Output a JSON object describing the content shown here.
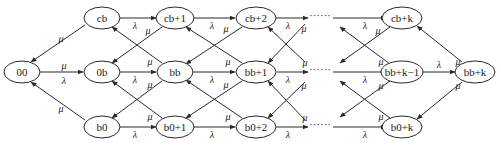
{
  "diagram": {
    "type": "state-transition-diagram",
    "rates": {
      "arrival": "λ",
      "service": "μ"
    },
    "ellipsis": "······",
    "nodes": [
      {
        "id": "00",
        "label": "00",
        "x": 22,
        "y": 72
      },
      {
        "id": "cb",
        "label": "cb",
        "x": 102,
        "y": 18
      },
      {
        "id": "0b",
        "label": "0b",
        "x": 102,
        "y": 72
      },
      {
        "id": "b0",
        "label": "b0",
        "x": 102,
        "y": 127
      },
      {
        "id": "cb+1",
        "label": "cb+1",
        "x": 175,
        "y": 18
      },
      {
        "id": "bb",
        "label": "bb",
        "x": 175,
        "y": 72
      },
      {
        "id": "b0+1",
        "label": "b0+1",
        "x": 175,
        "y": 127
      },
      {
        "id": "cb+2",
        "label": "cb+2",
        "x": 256,
        "y": 18
      },
      {
        "id": "bb+1",
        "label": "bb+1",
        "x": 256,
        "y": 72
      },
      {
        "id": "b0+2",
        "label": "b0+2",
        "x": 256,
        "y": 127
      },
      {
        "id": "cb+k",
        "label": "cb+k",
        "x": 402,
        "y": 18
      },
      {
        "id": "bb+k-1",
        "label": "bb+k−1",
        "x": 402,
        "y": 72
      },
      {
        "id": "b0+k",
        "label": "b0+k",
        "x": 402,
        "y": 127
      },
      {
        "id": "bb+k",
        "label": "bb+k",
        "x": 475,
        "y": 72
      }
    ],
    "ellipses": [
      {
        "row": "top",
        "x": 320,
        "y": 16
      },
      {
        "row": "middle",
        "x": 320,
        "y": 70
      },
      {
        "row": "bottom",
        "x": 320,
        "y": 125
      }
    ],
    "edges": [
      {
        "from": "00",
        "to": "0b",
        "labels": [
          "μ",
          "λ"
        ]
      },
      {
        "from": "cb",
        "to": "00",
        "label": "μ"
      },
      {
        "from": "b0",
        "to": "00",
        "label": "μ"
      },
      {
        "from": "cb",
        "to": "cb+1",
        "label": "λ"
      },
      {
        "from": "0b",
        "to": "bb",
        "label": "λ"
      },
      {
        "from": "b0",
        "to": "b0+1",
        "label": "λ"
      },
      {
        "from": "cb+1",
        "to": "0b",
        "label": "μ"
      },
      {
        "from": "bb",
        "to": "cb",
        "label": "μ"
      },
      {
        "from": "bb",
        "to": "b0",
        "label": "μ"
      },
      {
        "from": "b0+1",
        "to": "0b",
        "label": "μ"
      },
      {
        "from": "cb+1",
        "to": "cb+2",
        "label": "λ"
      },
      {
        "from": "bb",
        "to": "bb+1",
        "label": "λ"
      },
      {
        "from": "b0+1",
        "to": "b0+2",
        "label": "λ"
      },
      {
        "from": "cb+2",
        "to": "bb",
        "label": "μ"
      },
      {
        "from": "bb+1",
        "to": "cb+1",
        "label": "μ"
      },
      {
        "from": "bb+1",
        "to": "b0+1",
        "label": "μ"
      },
      {
        "from": "b0+2",
        "to": "bb",
        "label": "μ"
      },
      {
        "from": "bb+k-1",
        "to": "bb+k",
        "label": "λ"
      },
      {
        "from": "bb+k",
        "to": "cb+k",
        "label": "μ"
      },
      {
        "from": "bb+k",
        "to": "b0+k",
        "label": "μ"
      }
    ]
  }
}
